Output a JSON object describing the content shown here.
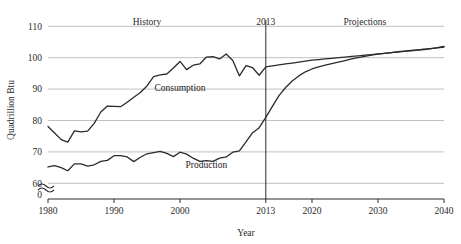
{
  "chart_data": {
    "type": "line",
    "title": "",
    "xlabel": "Year",
    "ylabel": "Quadrillion Btu",
    "xlim": [
      1980,
      2040
    ],
    "ylim": [
      55,
      112
    ],
    "y_ticks": [
      "110",
      "100",
      "90",
      "80",
      "70",
      "60",
      "0"
    ],
    "y_tick_values": [
      110,
      100,
      90,
      80,
      70,
      60
    ],
    "x_ticks": [
      "1980",
      "1990",
      "2000",
      "2013",
      "2020",
      "2030",
      "2040"
    ],
    "x_tick_values": [
      1980,
      1990,
      2000,
      2013,
      2020,
      2030,
      2040
    ],
    "grid": true,
    "grid_axis": "y",
    "axis_break": true,
    "axis_break_symbol": "approximately-equal-wave",
    "legend": "inline-annotations",
    "annotations": [
      {
        "name": "history-label",
        "text": "History",
        "x": 1995,
        "y": 110.5
      },
      {
        "name": "divider-year-label",
        "text": "2013",
        "x": 2013,
        "y": 110.5
      },
      {
        "name": "projections-label",
        "text": "Projections",
        "x": 2028,
        "y": 110.5
      },
      {
        "name": "consumption-label",
        "text": "Consumption",
        "x": 2000,
        "y": 89.5
      },
      {
        "name": "production-label",
        "text": "Production",
        "x": 2004,
        "y": 65.0
      }
    ],
    "divider": {
      "name": "projection-divider",
      "x": 2013,
      "label": "2013"
    },
    "series": [
      {
        "name": "Consumption",
        "color": "#2b2b2b",
        "x": [
          1980,
          1981,
          1982,
          1983,
          1984,
          1985,
          1986,
          1987,
          1988,
          1989,
          1990,
          1991,
          1992,
          1993,
          1994,
          1995,
          1996,
          1997,
          1998,
          1999,
          2000,
          2001,
          2002,
          2003,
          2004,
          2005,
          2006,
          2007,
          2008,
          2009,
          2010,
          2011,
          2012,
          2013,
          2014,
          2015,
          2016,
          2017,
          2018,
          2019,
          2020,
          2021,
          2022,
          2023,
          2024,
          2025,
          2026,
          2027,
          2028,
          2029,
          2030,
          2031,
          2032,
          2033,
          2034,
          2035,
          2036,
          2037,
          2038,
          2039,
          2040
        ],
        "values": [
          78.1,
          76.0,
          73.9,
          73.1,
          76.7,
          76.4,
          76.6,
          79.1,
          82.7,
          84.6,
          84.5,
          84.4,
          85.8,
          87.4,
          88.9,
          91.0,
          94.0,
          94.5,
          94.8,
          96.7,
          98.8,
          96.2,
          97.6,
          98.0,
          100.2,
          100.3,
          99.6,
          101.2,
          99.1,
          94.2,
          97.5,
          96.8,
          94.4,
          97.1,
          97.4,
          97.7,
          98.0,
          98.3,
          98.6,
          98.9,
          99.2,
          99.4,
          99.6,
          99.8,
          100.0,
          100.2,
          100.4,
          100.6,
          100.8,
          101.0,
          101.2,
          101.4,
          101.6,
          101.8,
          102.0,
          102.2,
          102.4,
          102.6,
          102.9,
          103.2,
          103.6
        ]
      },
      {
        "name": "Production",
        "color": "#2b2b2b",
        "x": [
          1980,
          1981,
          1982,
          1983,
          1984,
          1985,
          1986,
          1987,
          1988,
          1989,
          1990,
          1991,
          1992,
          1993,
          1994,
          1995,
          1996,
          1997,
          1998,
          1999,
          2000,
          2001,
          2002,
          2003,
          2004,
          2005,
          2006,
          2007,
          2008,
          2009,
          2010,
          2011,
          2012,
          2013,
          2014,
          2015,
          2016,
          2017,
          2018,
          2019,
          2020,
          2021,
          2022,
          2023,
          2024,
          2025,
          2026,
          2027,
          2028,
          2029,
          2030,
          2031,
          2032,
          2033,
          2034,
          2035,
          2036,
          2037,
          2038,
          2039,
          2040
        ],
        "values": [
          65.2,
          65.6,
          65.0,
          64.0,
          66.2,
          66.2,
          65.5,
          65.9,
          67.0,
          67.3,
          68.8,
          68.8,
          68.4,
          66.9,
          68.3,
          69.4,
          69.8,
          70.2,
          69.5,
          68.5,
          69.9,
          69.3,
          68.0,
          67.0,
          67.2,
          67.0,
          68.0,
          68.4,
          69.9,
          70.3,
          73.2,
          76.1,
          77.7,
          81.0,
          84.5,
          87.9,
          90.5,
          92.6,
          94.2,
          95.5,
          96.4,
          97.1,
          97.6,
          98.1,
          98.6,
          99.1,
          99.6,
          100.0,
          100.4,
          100.8,
          101.1,
          101.4,
          101.6,
          101.9,
          102.1,
          102.3,
          102.5,
          102.7,
          102.9,
          103.1,
          103.4
        ]
      }
    ]
  }
}
